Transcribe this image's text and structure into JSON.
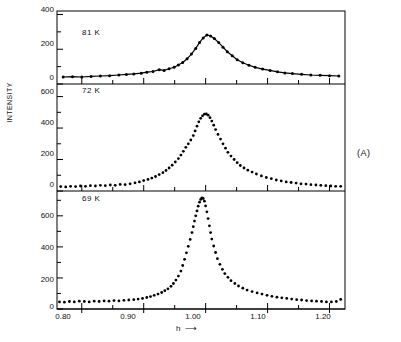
{
  "figure": {
    "panel_tag": "(A)",
    "ylabel": "INTENSITY",
    "xlabel": "h",
    "xlabel_arrow": "⟶"
  },
  "axes": {
    "x_ticks": [
      "0.80",
      "0.90",
      "1.00",
      "1.10",
      "1.20"
    ],
    "x_range": [
      0.76,
      1.225
    ],
    "x_minor_per_major": 2,
    "panels": [
      {
        "temperature": "81 K",
        "y_ticks": [
          "400",
          "200",
          "0"
        ],
        "y_values": [
          400,
          200,
          0
        ],
        "ylim": [
          0,
          420
        ]
      },
      {
        "temperature": "72 K",
        "y_ticks": [
          "600",
          "400",
          "200",
          "0"
        ],
        "y_values": [
          600,
          400,
          200,
          0
        ],
        "ylim": [
          0,
          680
        ]
      },
      {
        "temperature": "69 K",
        "y_ticks": [
          "600",
          "400",
          "200",
          "0"
        ],
        "y_values": [
          600,
          400,
          200,
          0
        ],
        "ylim": [
          0,
          760
        ]
      }
    ]
  },
  "chart_data": {
    "type": "scatter",
    "title": "",
    "xlabel": "h",
    "ylabel": "INTENSITY",
    "grid": false,
    "legend": "none",
    "annotations": [
      "81 K",
      "72 K",
      "69 K",
      "(A)"
    ],
    "series": [
      {
        "name": "81 K",
        "panel": 0,
        "has_fit_line": true,
        "xlim": [
          0.76,
          1.225
        ],
        "ylim": [
          0,
          420
        ],
        "x": [
          0.77,
          0.785,
          0.8,
          0.815,
          0.83,
          0.845,
          0.86,
          0.872,
          0.884,
          0.896,
          0.905,
          0.915,
          0.925,
          0.933,
          0.941,
          0.949,
          0.956,
          0.963,
          0.97,
          0.977,
          0.984,
          0.99,
          0.996,
          1.002,
          1.008,
          1.014,
          1.021,
          1.028,
          1.035,
          1.043,
          1.051,
          1.06,
          1.07,
          1.08,
          1.092,
          1.104,
          1.116,
          1.128,
          1.14,
          1.155,
          1.17,
          1.185,
          1.2,
          1.215
        ],
        "y": [
          40,
          42,
          40,
          44,
          46,
          48,
          52,
          55,
          58,
          62,
          68,
          72,
          82,
          78,
          88,
          96,
          110,
          124,
          145,
          172,
          205,
          238,
          265,
          282,
          276,
          262,
          238,
          212,
          186,
          162,
          140,
          122,
          108,
          96,
          86,
          78,
          70,
          64,
          60,
          56,
          52,
          50,
          48,
          46
        ]
      },
      {
        "name": "72 K",
        "panel": 1,
        "has_fit_line": false,
        "xlim": [
          0.76,
          1.225
        ],
        "ylim": [
          0,
          680
        ],
        "x": [
          0.766,
          0.774,
          0.782,
          0.79,
          0.798,
          0.806,
          0.814,
          0.822,
          0.83,
          0.838,
          0.846,
          0.854,
          0.862,
          0.87,
          0.878,
          0.886,
          0.893,
          0.9,
          0.907,
          0.913,
          0.919,
          0.925,
          0.931,
          0.936,
          0.941,
          0.946,
          0.951,
          0.956,
          0.96,
          0.964,
          0.968,
          0.972,
          0.976,
          0.98,
          0.983,
          0.986,
          0.989,
          0.992,
          0.995,
          0.998,
          1.001,
          1.004,
          1.007,
          1.01,
          1.013,
          1.016,
          1.02,
          1.024,
          1.028,
          1.032,
          1.036,
          1.041,
          1.046,
          1.051,
          1.056,
          1.062,
          1.068,
          1.075,
          1.082,
          1.09,
          1.098,
          1.106,
          1.114,
          1.122,
          1.13,
          1.138,
          1.146,
          1.154,
          1.162,
          1.17,
          1.178,
          1.186,
          1.194,
          1.202,
          1.21,
          1.218
        ],
        "y": [
          28,
          26,
          30,
          28,
          32,
          30,
          34,
          32,
          36,
          34,
          38,
          36,
          42,
          40,
          46,
          52,
          58,
          66,
          74,
          82,
          92,
          104,
          116,
          130,
          146,
          164,
          184,
          206,
          228,
          252,
          278,
          300,
          324,
          352,
          382,
          412,
          440,
          462,
          478,
          488,
          490,
          482,
          466,
          444,
          418,
          390,
          360,
          330,
          300,
          272,
          246,
          222,
          200,
          180,
          162,
          146,
          132,
          120,
          108,
          96,
          86,
          78,
          70,
          64,
          58,
          54,
          50,
          46,
          44,
          40,
          38,
          36,
          34,
          32,
          30,
          30
        ]
      },
      {
        "name": "69 K",
        "panel": 2,
        "has_fit_line": false,
        "xlim": [
          0.76,
          1.225
        ],
        "ylim": [
          0,
          760
        ],
        "x": [
          0.764,
          0.772,
          0.78,
          0.788,
          0.796,
          0.804,
          0.812,
          0.82,
          0.828,
          0.836,
          0.844,
          0.852,
          0.86,
          0.868,
          0.876,
          0.884,
          0.891,
          0.898,
          0.905,
          0.911,
          0.917,
          0.923,
          0.929,
          0.934,
          0.939,
          0.944,
          0.948,
          0.952,
          0.956,
          0.96,
          0.963,
          0.966,
          0.969,
          0.972,
          0.975,
          0.978,
          0.98,
          0.982,
          0.984,
          0.986,
          0.988,
          0.99,
          0.992,
          0.994,
          0.996,
          0.998,
          1.0,
          1.002,
          1.004,
          1.006,
          1.008,
          1.01,
          1.013,
          1.016,
          1.019,
          1.023,
          1.027,
          1.031,
          1.036,
          1.041,
          1.047,
          1.053,
          1.06,
          1.067,
          1.075,
          1.083,
          1.091,
          1.099,
          1.107,
          1.115,
          1.123,
          1.131,
          1.139,
          1.147,
          1.155,
          1.163,
          1.171,
          1.179,
          1.187,
          1.195,
          1.203,
          1.211,
          1.218
        ],
        "y": [
          46,
          44,
          48,
          46,
          50,
          48,
          46,
          50,
          48,
          52,
          50,
          54,
          52,
          56,
          58,
          60,
          64,
          68,
          74,
          80,
          88,
          96,
          106,
          118,
          130,
          146,
          164,
          186,
          212,
          244,
          280,
          320,
          362,
          404,
          448,
          492,
          530,
          566,
          600,
          632,
          662,
          688,
          706,
          716,
          712,
          694,
          664,
          626,
          582,
          536,
          492,
          450,
          406,
          364,
          324,
          288,
          256,
          228,
          204,
          182,
          164,
          148,
          134,
          122,
          112,
          104,
          96,
          88,
          82,
          76,
          72,
          68,
          64,
          60,
          58,
          54,
          52,
          50,
          48,
          46,
          46,
          48,
          62
        ]
      }
    ]
  }
}
